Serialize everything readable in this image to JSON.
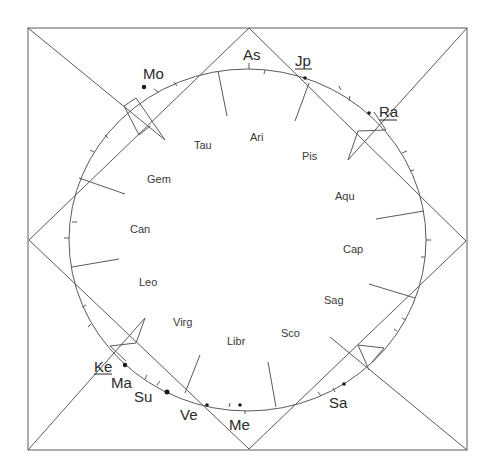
{
  "chart": {
    "type": "astrological-birth-chart",
    "frame": {
      "x1": 28,
      "y1": 28,
      "x2": 467,
      "y2": 450
    },
    "diamond": {
      "top": [
        249,
        28
      ],
      "right": [
        466,
        241
      ],
      "bottom": [
        249,
        449
      ],
      "left": [
        29,
        240
      ]
    },
    "wheel": {
      "cx": 247.5,
      "cy": 240,
      "rx": 178.5,
      "ry": 171
    }
  },
  "signs": [
    {
      "name": "Ari",
      "x": 258,
      "y": 141
    },
    {
      "name": "Tau",
      "x": 204,
      "y": 149
    },
    {
      "name": "Pis",
      "x": 311,
      "y": 160
    },
    {
      "name": "Gem",
      "x": 160,
      "y": 183
    },
    {
      "name": "Aqu",
      "x": 345,
      "y": 200
    },
    {
      "name": "Can",
      "x": 141,
      "y": 233
    },
    {
      "name": "Cap",
      "x": 354,
      "y": 253
    },
    {
      "name": "Leo",
      "x": 149,
      "y": 286
    },
    {
      "name": "Sag",
      "x": 334,
      "y": 304
    },
    {
      "name": "Virg",
      "x": 184,
      "y": 326
    },
    {
      "name": "Sco",
      "x": 292,
      "y": 337
    },
    {
      "name": "Libr",
      "x": 237,
      "y": 345
    }
  ],
  "planets": [
    {
      "name": "As",
      "label_x": 253,
      "label_y": 60,
      "dot": null,
      "underlined": false
    },
    {
      "name": "Jp",
      "label_x": 304,
      "label_y": 66,
      "dot": [
        305,
        78
      ],
      "underlined": true
    },
    {
      "name": "Mo",
      "label_x": 153,
      "label_y": 79,
      "dot": [
        145,
        87
      ],
      "underlined": false
    },
    {
      "name": "Ra",
      "label_x": 388,
      "label_y": 117,
      "dot": [
        370,
        113
      ],
      "underlined": true
    },
    {
      "name": "Ke",
      "label_x": 104,
      "label_y": 372,
      "dot": [
        125,
        365
      ],
      "underlined": true
    },
    {
      "name": "Ma",
      "label_x": 122,
      "label_y": 388,
      "dot": null,
      "underlined": false
    },
    {
      "name": "Su",
      "label_x": 144,
      "label_y": 402,
      "dot": [
        167,
        392
      ],
      "underlined": false
    },
    {
      "name": "Ve",
      "label_x": 189,
      "label_y": 420,
      "dot": [
        207,
        405
      ],
      "underlined": false
    },
    {
      "name": "Me",
      "label_x": 240,
      "label_y": 430,
      "dot": [
        240,
        405
      ],
      "underlined": false
    },
    {
      "name": "Sa",
      "label_x": 339,
      "label_y": 408,
      "dot": [
        344,
        384
      ],
      "underlined": false
    }
  ],
  "colors": {
    "line": "#5a5a5a",
    "text": "#2a2a2a",
    "background": "#ffffff"
  }
}
